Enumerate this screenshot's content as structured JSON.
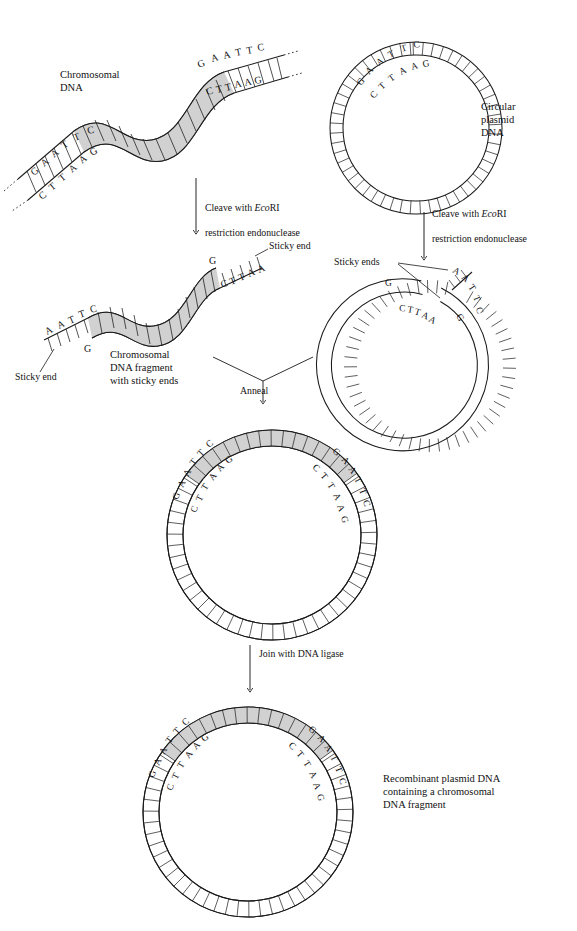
{
  "figure": {
    "type": "molecular-biology-process-diagram",
    "colors": {
      "stroke": "#1a1a1a",
      "background": "#ffffff",
      "chromosomal_fill": "#cfcfcf",
      "plasmid_fill": "#ffffff",
      "text": "#121212"
    }
  },
  "labels": {
    "chromosomal_dna": "Chromosomal\nDNA",
    "circular_plasmid_dna": "Circular\nplasmid\nDNA",
    "cleave_left": "Cleave with EcoRI\nrestriction endonuclease",
    "cleave_right": "Cleave with EcoRI\nrestriction endonuclease",
    "cleave_enzyme_italic": "Eco",
    "cleave_enzyme_roman": "RI",
    "cleave_line1_prefix": "Cleave with ",
    "cleave_line2": "restriction endonuclease",
    "sticky_end_upper": "Sticky end",
    "sticky_end_lower": "Sticky end",
    "sticky_ends_plasmid": "Sticky ends",
    "fragment_caption": "Chromosomal\nDNA fragment\nwith sticky ends",
    "anneal": "Anneal",
    "join_ligase": "Join with DNA ligase",
    "recombinant_caption": "Recombinant plasmid DNA\ncontaining a chromosomal\nDNA fragment"
  },
  "sequences": {
    "top_strand_full": "GAATTC",
    "bottom_strand_full": "CTTAAG",
    "sticky_top_left": "AATTC",
    "sticky_bottom_left": "G",
    "sticky_top_right": "G",
    "sticky_bottom_right": "CTTAA",
    "plasmid_cut_top_left": "G",
    "plasmid_cut_bottom_left": "CTTAA",
    "plasmid_cut_top_right": "AATTC",
    "plasmid_cut_bottom_right": "G",
    "letters": {
      "G": "G",
      "A": "A",
      "T": "T",
      "C": "C"
    }
  },
  "panels": [
    {
      "id": "chromosomal-dna",
      "label": "Chromosomal DNA",
      "top_sequence": "GAATTC",
      "bottom_sequence": "CTTAAG",
      "ends": 2
    },
    {
      "id": "circular-plasmid",
      "label": "Circular plasmid DNA",
      "top_sequence": "GAATTC",
      "bottom_sequence": "CTTAAG"
    },
    {
      "id": "chromosomal-fragment",
      "label": "Chromosomal DNA fragment with sticky ends",
      "left_top": "AATTC",
      "left_bottom": "G",
      "right_top": "G",
      "right_bottom": "CTTAA"
    },
    {
      "id": "cleaved-plasmid",
      "label": "Sticky ends",
      "left_top": "G",
      "left_bottom": "CTTAA",
      "right_top": "AATTC",
      "right_bottom": "G"
    },
    {
      "id": "annealed-plasmid",
      "label": "Anneal",
      "junction_left_outer": "GAATTC",
      "junction_left_inner": "CTTAAG",
      "junction_right_outer": "GAATTC",
      "junction_right_inner": "CTTAAG"
    },
    {
      "id": "recombinant-plasmid",
      "label": "Recombinant plasmid DNA containing a chromosomal DNA fragment",
      "junction_left_outer": "GAATTC",
      "junction_left_inner": "CTTAAG",
      "junction_right_outer": "GAATTC",
      "junction_right_inner": "CTTAAG"
    }
  ],
  "steps": [
    "Cleave with EcoRI restriction endonuclease",
    "Anneal",
    "Join with DNA ligase"
  ]
}
